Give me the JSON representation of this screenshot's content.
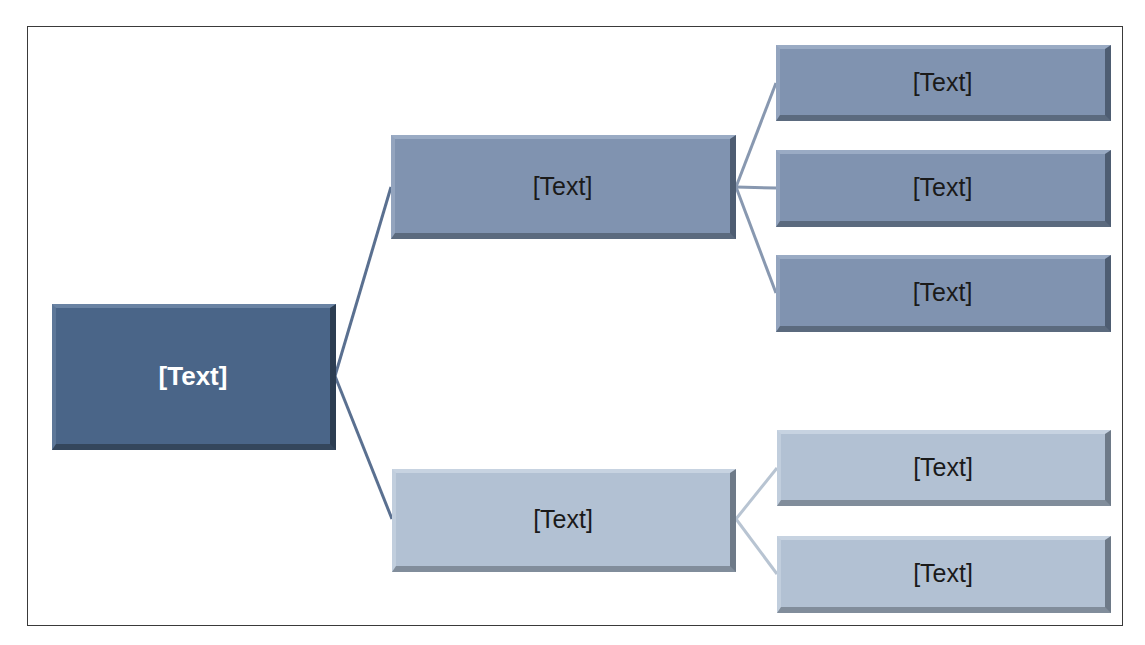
{
  "diagram": {
    "type": "hierarchy",
    "colors": {
      "root_fill": "#4a6588",
      "level2_upper_fill": "#8093b0",
      "level2_lower_fill": "#b2c1d3",
      "root_connector": "#5a7090",
      "upper_connector": "#8898b0",
      "lower_connector": "#b8c4d2",
      "frame_border": "#3a3a3a"
    },
    "root": {
      "label": "[Text]"
    },
    "branches": [
      {
        "label": "[Text]",
        "children": [
          {
            "label": "[Text]"
          },
          {
            "label": "[Text]"
          },
          {
            "label": "[Text]"
          }
        ]
      },
      {
        "label": "[Text]",
        "children": [
          {
            "label": "[Text]"
          },
          {
            "label": "[Text]"
          }
        ]
      }
    ]
  }
}
